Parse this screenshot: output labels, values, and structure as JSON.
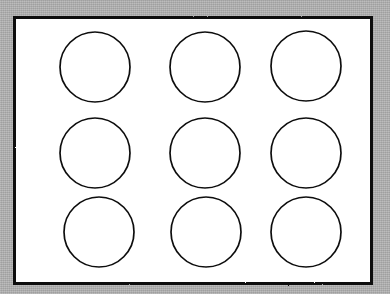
{
  "document": {
    "kind": "scanned-line-drawing",
    "title": "Grid of nine circles",
    "description": "A black rectangular frame on a gray scanned background enclosing a white field with a three by three grid of hand-drawn open circles.",
    "canvas": {
      "width": 390,
      "height": 294
    }
  },
  "colors": {
    "background_gray": "#aeaeae",
    "paper_white": "#ffffff",
    "ink_black": "#101010",
    "circle_stroke": "#0d0d0d"
  },
  "frame": {
    "name": "outer rectangle",
    "x": 14.5,
    "y": 17.5,
    "width": 357,
    "height": 266,
    "stroke_width": 3,
    "fill": "#ffffff",
    "stroke": "#101010"
  },
  "grid": {
    "rows": 3,
    "columns": 3,
    "count": 9,
    "column_centers_x": [
      95,
      205,
      306
    ],
    "row_centers_y": [
      67,
      153,
      232
    ],
    "circle_radius": 35,
    "circle_diameter": 70,
    "stroke_width": 1.7
  },
  "chart_data": {
    "type": "scatter",
    "xlabel": "",
    "ylabel": "",
    "xlim": [
      0,
      390
    ],
    "ylim": [
      0,
      294
    ],
    "grid": false,
    "legend": "none",
    "series": [
      {
        "name": "circles",
        "marker": "open-circle",
        "marker_radius": 35,
        "points": [
          {
            "id": "circle-r1c1",
            "row": 1,
            "col": 1,
            "cx": 95,
            "cy": 67,
            "r": 35
          },
          {
            "id": "circle-r1c2",
            "row": 1,
            "col": 2,
            "cx": 205,
            "cy": 67,
            "r": 35
          },
          {
            "id": "circle-r1c3",
            "row": 1,
            "col": 3,
            "cx": 306,
            "cy": 66,
            "r": 35
          },
          {
            "id": "circle-r2c1",
            "row": 2,
            "col": 1,
            "cx": 95,
            "cy": 153,
            "r": 35
          },
          {
            "id": "circle-r2c2",
            "row": 2,
            "col": 2,
            "cx": 205,
            "cy": 153,
            "r": 35
          },
          {
            "id": "circle-r2c3",
            "row": 2,
            "col": 3,
            "cx": 306,
            "cy": 153,
            "r": 35
          },
          {
            "id": "circle-r3c1",
            "row": 3,
            "col": 1,
            "cx": 99,
            "cy": 232,
            "r": 35
          },
          {
            "id": "circle-r3c2",
            "row": 3,
            "col": 2,
            "cx": 206,
            "cy": 232,
            "r": 35
          },
          {
            "id": "circle-r3c3",
            "row": 3,
            "col": 3,
            "cx": 306,
            "cy": 232,
            "r": 35
          }
        ]
      }
    ]
  }
}
